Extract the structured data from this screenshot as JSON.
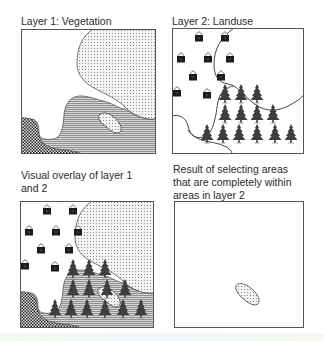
{
  "figure": {
    "panels": [
      {
        "id": "layer1",
        "caption_lines": [
          "Layer 1: Vegetation"
        ],
        "content": "Vegetation polygons: white, dotted, horizontal-hatched, checkered, dotted oval"
      },
      {
        "id": "layer2",
        "caption_lines": [
          "Layer 2: Landuse"
        ],
        "content": "Landuse areas: houses (residential), trees (forest), empty regions",
        "houses": 10,
        "trees": 17
      },
      {
        "id": "overlay",
        "caption_lines": [
          "Visual overlay of layer 1",
          "and 2"
        ],
        "content": "Layer 1 and layer 2 superimposed"
      },
      {
        "id": "result",
        "caption_lines": [
          "Result of selecting areas",
          "that are completely within",
          "areas in layer 2"
        ],
        "content": "Only the dotted oval polygon remains"
      }
    ],
    "legend_patterns": {
      "dotted": "#cfcfcf",
      "hatched": "#9a9a9a",
      "checkered": "#3a3a3a",
      "icon_color": "#1e1e1e",
      "border_color": "#555555"
    }
  }
}
